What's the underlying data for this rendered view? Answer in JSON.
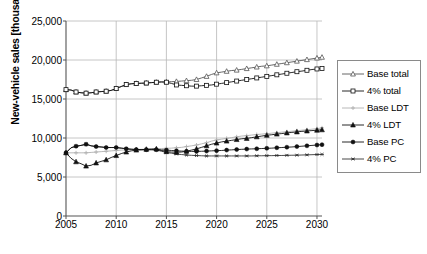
{
  "chart_data": {
    "type": "line",
    "title": "",
    "xlabel": "",
    "ylabel": "New-vehicle sales [thousand]",
    "xlim": [
      2005,
      2030.5
    ],
    "ylim": [
      0,
      25000
    ],
    "grid": true,
    "legend_position": "right",
    "x_ticks": [
      "2005",
      "2010",
      "2015",
      "2020",
      "2025",
      "2030"
    ],
    "x_tick_values": [
      2005,
      2010,
      2015,
      2020,
      2025,
      2030
    ],
    "y_ticks": [
      "0",
      "5,000",
      "10,000",
      "15,000",
      "20,000",
      "25,000"
    ],
    "y_tick_values": [
      0,
      5000,
      10000,
      15000,
      20000,
      25000
    ],
    "x": [
      2005,
      2005.5,
      2006,
      2006.5,
      2007,
      2007.5,
      2008,
      2008.5,
      2009,
      2009.5,
      2010,
      2010.5,
      2011,
      2011.5,
      2012,
      2012.5,
      2013,
      2013.5,
      2014,
      2014.5,
      2015,
      2015.5,
      2016,
      2016.5,
      2017,
      2017.5,
      2018,
      2018.5,
      2019,
      2019.5,
      2020,
      2020.5,
      2021,
      2021.5,
      2022,
      2022.5,
      2023,
      2023.5,
      2024,
      2024.5,
      2025,
      2025.5,
      2026,
      2026.5,
      2027,
      2027.5,
      2028,
      2028.5,
      2029,
      2029.5,
      2030,
      2030.5
    ],
    "series": [
      {
        "name": "Base total",
        "marker": "open-triangle",
        "color": "#555555",
        "values": [
          16200,
          16150,
          15900,
          15800,
          15750,
          15800,
          15900,
          15950,
          16000,
          16100,
          16350,
          16600,
          16850,
          16950,
          17000,
          17020,
          17050,
          17100,
          17150,
          17200,
          17200,
          17220,
          17250,
          17300,
          17350,
          17400,
          17500,
          17700,
          17900,
          18150,
          18350,
          18450,
          18550,
          18650,
          18700,
          18800,
          18900,
          19000,
          19100,
          19200,
          19250,
          19350,
          19450,
          19550,
          19650,
          19750,
          19850,
          19950,
          20050,
          20150,
          20250,
          20350
        ]
      },
      {
        "name": "4% total",
        "marker": "open-square",
        "color": "#111111",
        "values": [
          16200,
          16150,
          15900,
          15800,
          15750,
          15800,
          15900,
          15950,
          16000,
          16100,
          16350,
          16600,
          16850,
          16950,
          17000,
          17020,
          17050,
          17100,
          17150,
          17180,
          17150,
          17000,
          16800,
          16750,
          16700,
          16650,
          16650,
          16700,
          16750,
          16800,
          16900,
          17000,
          17100,
          17200,
          17300,
          17400,
          17500,
          17600,
          17700,
          17800,
          17900,
          18000,
          18100,
          18200,
          18300,
          18400,
          18500,
          18580,
          18680,
          18780,
          18850,
          18900
        ]
      },
      {
        "name": "Base LDT",
        "marker": "light-cross",
        "color": "#b0b0b0",
        "values": [
          8100,
          8100,
          8100,
          8100,
          8100,
          8150,
          8200,
          8250,
          8300,
          8350,
          8400,
          8450,
          8480,
          8500,
          8520,
          8550,
          8570,
          8600,
          8620,
          8650,
          8680,
          8700,
          8750,
          8800,
          8900,
          9000,
          9100,
          9250,
          9400,
          9600,
          9750,
          9850,
          9950,
          10050,
          10150,
          10250,
          10300,
          10380,
          10450,
          10500,
          10550,
          10620,
          10680,
          10750,
          10800,
          10870,
          10930,
          11000,
          11060,
          11130,
          11200,
          11300
        ]
      },
      {
        "name": "4% LDT",
        "marker": "filled-triangle",
        "color": "#111111",
        "values": [
          8100,
          7400,
          6950,
          6700,
          6400,
          6500,
          6800,
          7000,
          7200,
          7500,
          7750,
          8000,
          8200,
          8350,
          8450,
          8500,
          8550,
          8580,
          8600,
          8400,
          8250,
          8200,
          8180,
          8200,
          8300,
          8450,
          8600,
          8800,
          9000,
          9200,
          9350,
          9500,
          9600,
          9700,
          9800,
          9900,
          9950,
          10050,
          10150,
          10250,
          10350,
          10420,
          10500,
          10570,
          10650,
          10720,
          10780,
          10850,
          10900,
          10950,
          11000,
          11050
        ]
      },
      {
        "name": "Base PC",
        "marker": "filled-circle",
        "color": "#111111",
        "values": [
          8100,
          8750,
          8950,
          9050,
          9200,
          9000,
          8900,
          8850,
          8780,
          8780,
          8780,
          8700,
          8620,
          8560,
          8520,
          8500,
          8500,
          8500,
          8500,
          8480,
          8450,
          8400,
          8350,
          8320,
          8300,
          8280,
          8280,
          8300,
          8320,
          8350,
          8380,
          8400,
          8450,
          8480,
          8520,
          8550,
          8580,
          8600,
          8620,
          8650,
          8680,
          8700,
          8750,
          8780,
          8820,
          8850,
          8900,
          8950,
          9000,
          9050,
          9100,
          9150
        ]
      },
      {
        "name": "4% PC",
        "marker": "asterisk",
        "color": "#333333",
        "values": [
          8100,
          8750,
          8950,
          9050,
          9200,
          9000,
          8900,
          8850,
          8780,
          8780,
          8780,
          8700,
          8620,
          8560,
          8520,
          8500,
          8500,
          8500,
          8480,
          8300,
          8150,
          8050,
          7950,
          7880,
          7820,
          7780,
          7750,
          7720,
          7700,
          7700,
          7700,
          7700,
          7700,
          7700,
          7700,
          7700,
          7700,
          7700,
          7720,
          7720,
          7740,
          7740,
          7760,
          7760,
          7780,
          7790,
          7800,
          7820,
          7840,
          7860,
          7880,
          7900
        ]
      }
    ]
  }
}
